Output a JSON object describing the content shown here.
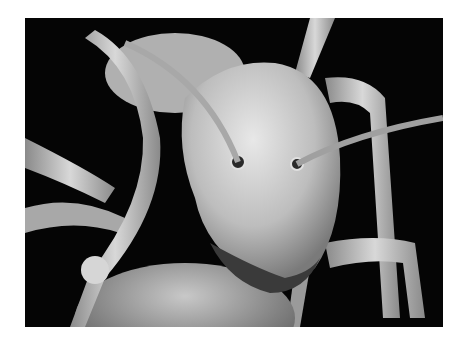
{
  "image": {
    "subject": "scanning electron micrograph of an ant head",
    "background_color": "#ffffff",
    "photo_background_color": "#050505",
    "tone": "grayscale"
  }
}
